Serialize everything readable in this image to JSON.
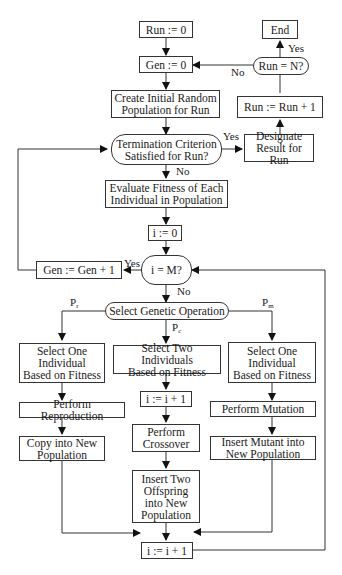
{
  "diagram": {
    "nodes": {
      "run_init": "Run := 0",
      "gen_init": "Gen := 0",
      "create_pop": "Create Initial Random\nPopulation for Run",
      "termination": "Termination Criterion\nSatisfied for Run?",
      "designate": "Designate\nResult for Run",
      "run_inc": "Run := Run + 1",
      "run_check": "Run = N?",
      "end": "End",
      "evaluate": "Evaluate Fitness of Each\nIndividual in Population",
      "i_init": "i := 0",
      "i_check": "i = M?",
      "gen_inc": "Gen := Gen + 1",
      "select_op": "Select Genetic Operation",
      "select_one_r": "Select One\nIndividual\nBased on Fitness",
      "select_two": "Select Two Individuals\nBased on Fitness",
      "select_one_m": "Select One\nIndividual\nBased on Fitness",
      "perform_repro": "Perform Reproduction",
      "i_inc_c": "i := i + 1",
      "perform_mut": "Perform Mutation",
      "copy_new": "Copy into New\nPopulation",
      "perform_cross": "Perform\nCrossover",
      "insert_mutant": "Insert Mutant into\nNew Population",
      "insert_two": "Insert Two\nOffspring\ninto New\nPopulation",
      "i_inc": "i := i + 1"
    },
    "edge_labels": {
      "yes_end": "Yes",
      "no_run": "No",
      "yes_term": "Yes",
      "no_term": "No",
      "yes_i": "Yes",
      "no_i": "No",
      "p_r": "P",
      "p_r_sub": "r",
      "p_c": "P",
      "p_c_sub": "c",
      "p_m": "P",
      "p_m_sub": "m"
    }
  }
}
